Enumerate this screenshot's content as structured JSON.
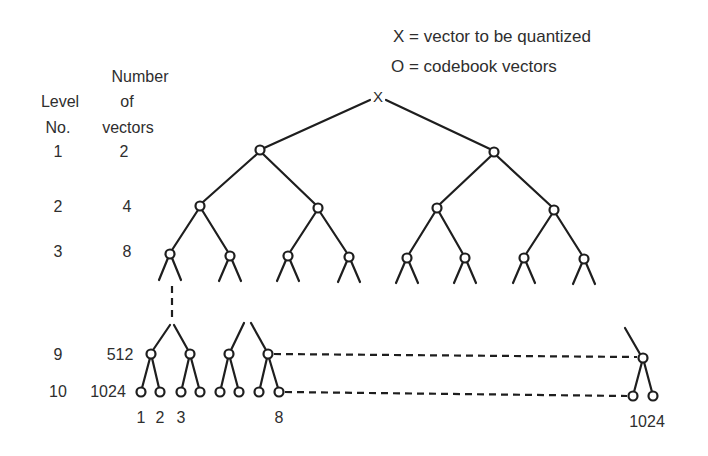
{
  "legend": {
    "x_line": "X  =  vector to be quantized",
    "o_line": "O  =  codebook vectors"
  },
  "headers": {
    "number_line1": "Number",
    "number_line2": "of",
    "number_line3": "vectors",
    "level_line1": "Level",
    "level_line2": "No."
  },
  "rows": [
    {
      "level": "1",
      "count": "2"
    },
    {
      "level": "2",
      "count": "4"
    },
    {
      "level": "3",
      "count": "8"
    },
    {
      "level": "9",
      "count": "512"
    },
    {
      "level": "10",
      "count": "1024"
    }
  ],
  "leaf_labels": [
    "1",
    "2",
    "3",
    "8",
    "1024"
  ],
  "root_symbol": "X",
  "colors": {
    "line": "#1e1e1e",
    "text": "#2e2e2e",
    "background": "#ffffff"
  }
}
